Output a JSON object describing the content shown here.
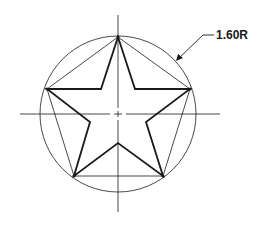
{
  "diagram": {
    "dimension_label": "1.60R",
    "colors": {
      "stroke": "#1a1a1a",
      "background": "#ffffff"
    },
    "center": [
      118,
      114
    ],
    "circle_radius": 78,
    "outer_vertices": [
      [
        118,
        37
      ],
      [
        190,
        89
      ],
      [
        163,
        176
      ],
      [
        74,
        176
      ],
      [
        47,
        89
      ]
    ],
    "inner_vertices": [
      [
        135,
        89
      ],
      [
        146,
        122
      ],
      [
        118,
        143
      ],
      [
        90,
        122
      ],
      [
        101,
        89
      ]
    ]
  }
}
